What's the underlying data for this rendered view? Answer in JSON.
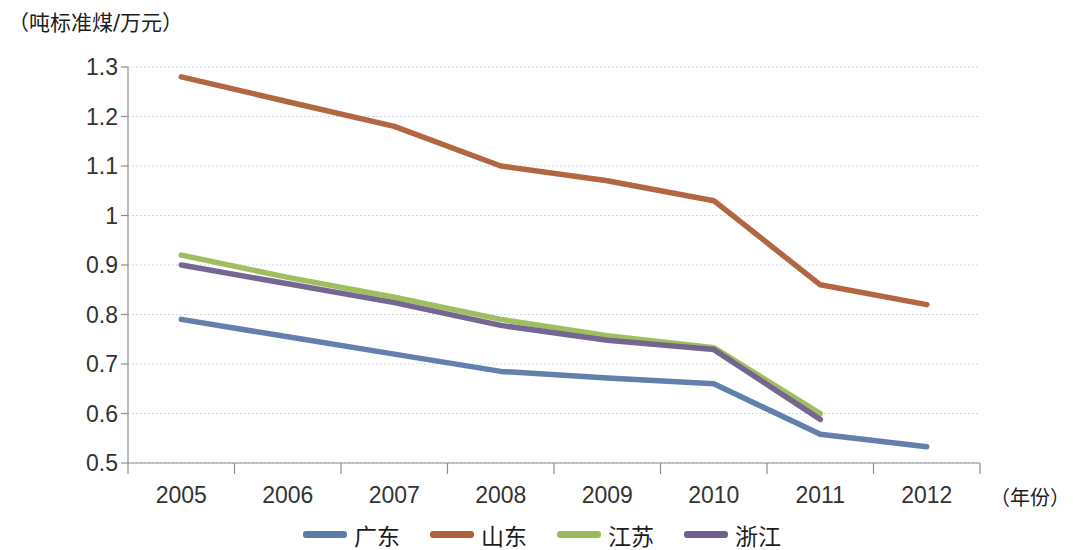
{
  "chart_data": {
    "type": "line",
    "title": "",
    "subtitle": "",
    "xlabel": "（年份）",
    "ylabel": "（吨标准煤/万元）",
    "categories": [
      "2005",
      "2006",
      "2007",
      "2008",
      "2009",
      "2010",
      "2011",
      "2012"
    ],
    "ylim": [
      0.5,
      1.3
    ],
    "ytick_labels": [
      "1.3",
      "1.2",
      "1.1",
      "1",
      "0.9",
      "0.8",
      "0.7",
      "0.6",
      "0.5"
    ],
    "ytick_values": [
      1.3,
      1.2,
      1.1,
      1.0,
      0.9,
      0.8,
      0.7,
      0.6,
      0.5
    ],
    "grid": true,
    "grid_style": "dotted-horizontal",
    "legend_position": "bottom",
    "series": [
      {
        "name": "广东",
        "color": "#5b7ba8",
        "values": [
          0.79,
          0.755,
          0.72,
          0.685,
          0.672,
          0.66,
          0.558,
          0.533
        ]
      },
      {
        "name": "山东",
        "color": "#b0603a",
        "values": [
          1.28,
          1.23,
          1.18,
          1.1,
          1.07,
          1.03,
          0.86,
          0.82
        ]
      },
      {
        "name": "江苏",
        "color": "#9bbb59",
        "values": [
          0.92,
          0.875,
          0.835,
          0.79,
          0.757,
          0.733,
          0.6,
          null
        ]
      },
      {
        "name": "浙江",
        "color": "#70608e",
        "values": [
          0.9,
          0.862,
          0.824,
          0.778,
          0.748,
          0.729,
          0.588,
          null
        ]
      }
    ]
  },
  "axis": {
    "y_unit_label": "（吨标准煤/万元）",
    "x_unit_label": "（年份）"
  },
  "legend": {
    "items": [
      {
        "label": "广东",
        "color": "#5b7ba8"
      },
      {
        "label": "山东",
        "color": "#b0603a"
      },
      {
        "label": "江苏",
        "color": "#9bbb59"
      },
      {
        "label": "浙江",
        "color": "#70608e"
      }
    ]
  }
}
